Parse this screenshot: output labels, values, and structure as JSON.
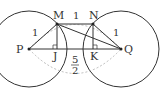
{
  "diagram": {
    "points": {
      "P": {
        "label": "P",
        "x": 29,
        "y": 49
      },
      "Q": {
        "label": "Q",
        "x": 121,
        "y": 49
      },
      "M": {
        "label": "M",
        "x": 57,
        "y": 24
      },
      "N": {
        "label": "N",
        "x": 93,
        "y": 24
      },
      "J": {
        "label": "J",
        "x": 57,
        "y": 49
      },
      "K": {
        "label": "K",
        "x": 93,
        "y": 49
      }
    },
    "circles": [
      {
        "center": "P",
        "r": 38
      },
      {
        "center": "Q",
        "r": 38
      }
    ],
    "labels": {
      "PM_length": "1",
      "MN_length": "1",
      "NQ_length": "1",
      "PQ_num": "5",
      "PQ_den": "2"
    },
    "colors": {
      "stroke": "#333333",
      "dashed": "#aaaaaa"
    }
  }
}
